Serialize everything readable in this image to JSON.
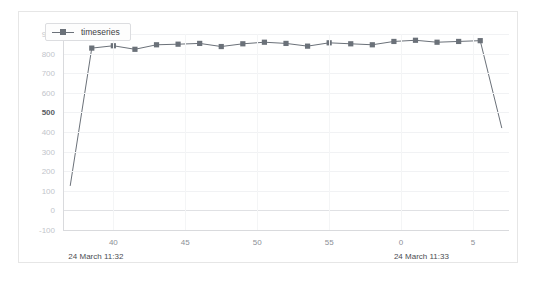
{
  "top_clip": {
    "text": "",
    "visible": false
  },
  "legend": {
    "entries": [
      {
        "label": "timeseries",
        "color": "#6b7179",
        "marker": "square"
      }
    ],
    "position": "top-left-inside"
  },
  "axis_time_labels": [
    {
      "text": "24 March 11:32",
      "x_frac": 0.012
    },
    {
      "text": "24 March 11:33",
      "x_frac": 0.742
    }
  ],
  "chart_data": {
    "type": "line",
    "title": "",
    "subtitle": "",
    "xlabel": "",
    "ylabel": "",
    "grid": true,
    "legend_position": "top-left",
    "ylim": [
      -100,
      900
    ],
    "yticks": [
      900,
      800,
      700,
      600,
      500,
      400,
      300,
      200,
      100,
      0,
      -100
    ],
    "ytick_labels": [
      "900",
      "800",
      "700",
      "600",
      "500",
      "400",
      "300",
      "200",
      "100",
      "0",
      "-100"
    ],
    "ytick_major": "500",
    "xlim": [
      36.5,
      67.5
    ],
    "xticks": [
      40,
      45,
      50,
      55,
      60,
      65
    ],
    "xtick_labels": [
      "40",
      "45",
      "50",
      "55",
      "0",
      "5"
    ],
    "x_axis_note": "seconds within minute; wraps from 11:32 to 11:33 at label 0",
    "series": [
      {
        "name": "timeseries",
        "color": "#6b7179",
        "marker": "square",
        "x": [
          37,
          38.5,
          40,
          41.5,
          43,
          44.5,
          46,
          47.5,
          49,
          50.5,
          52,
          53.5,
          55,
          56.5,
          58,
          59.5,
          61,
          62.5,
          64,
          65.5,
          67
        ],
        "values": [
          125,
          828,
          840,
          822,
          845,
          848,
          852,
          836,
          850,
          858,
          852,
          838,
          855,
          850,
          845,
          862,
          868,
          858,
          862,
          866,
          420
        ]
      }
    ]
  }
}
